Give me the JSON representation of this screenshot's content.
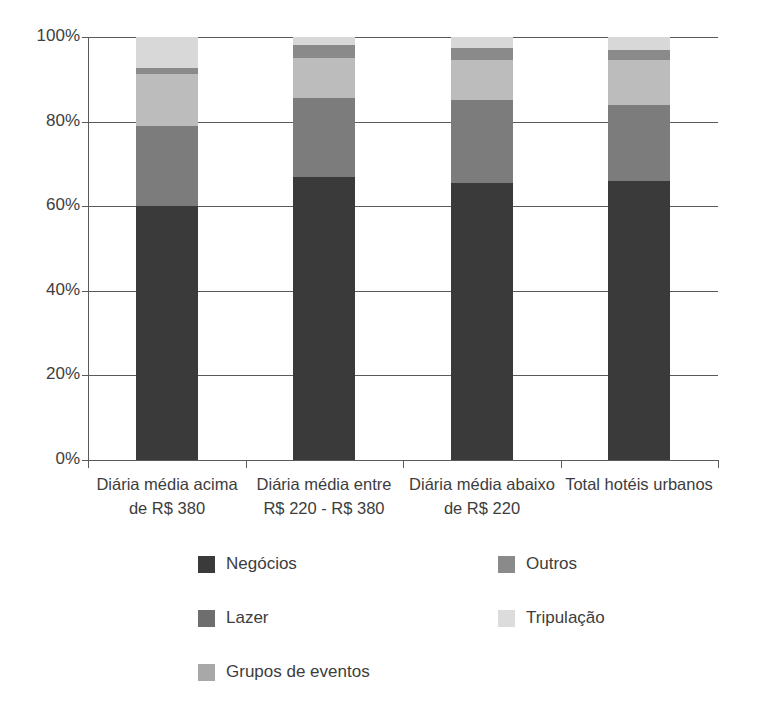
{
  "chart_data": {
    "type": "bar",
    "subtype": "stacked-percentage-column",
    "title": "",
    "xlabel": "",
    "ylabel": "",
    "ylim": [
      0,
      100
    ],
    "ytick_labels": [
      "0%",
      "20%",
      "40%",
      "60%",
      "80%",
      "100%"
    ],
    "ytick_values": [
      0,
      20,
      40,
      60,
      80,
      100
    ],
    "grid": true,
    "grid_axis": "y",
    "legend_position": "bottom",
    "stack_order_bottom_to_top": [
      "Negócios",
      "Lazer",
      "Outros",
      "Grupos de eventos",
      "Tripulação"
    ],
    "categories": [
      "Diária média acima de R$ 380",
      "Diária média entre R$ 220 - R$ 380",
      "Diária média abaixo de R$ 220",
      "Total hotéis urbanos"
    ],
    "category_lines": [
      [
        "Diária média acima",
        "de R$ 380"
      ],
      [
        "Diária média entre",
        "R$ 220 - R$ 380"
      ],
      [
        "Diária média abaixo",
        "de R$ 220"
      ],
      [
        "Total hotéis urbanos",
        ""
      ]
    ],
    "series": [
      {
        "name": "Negócios",
        "color": "#3a3a3a",
        "values": [
          61.5,
          67.0,
          65.5,
          66.0
        ]
      },
      {
        "name": "Lazer",
        "color": "#7c7c7c",
        "values": [
          19.5,
          18.5,
          19.5,
          18.0
        ]
      },
      {
        "name": "Outros",
        "color": "#bcbcbc",
        "values": [
          12.5,
          9.5,
          9.5,
          10.5
        ]
      },
      {
        "name": "Grupos de eventos",
        "color": "#8a8a8a",
        "values": [
          1.5,
          3.0,
          3.0,
          2.5
        ]
      },
      {
        "name": "Tripulação",
        "color": "#d8d8d8",
        "values": [
          7.5,
          2.0,
          2.5,
          3.0
        ]
      }
    ]
  },
  "legend": {
    "entries": [
      {
        "label": "Negócios",
        "color": "#3a3a3a"
      },
      {
        "label": "Outros",
        "color": "#8a8a8a"
      },
      {
        "label": "Lazer",
        "color": "#6e6e6e"
      },
      {
        "label": "Tripulação",
        "color": "#dcdcdc"
      },
      {
        "label": "Grupos de eventos",
        "color": "#a8a8a8"
      }
    ]
  },
  "colors": {
    "axis": "#5a5a5a",
    "text": "#3d3d3d",
    "background": "#ffffff"
  }
}
